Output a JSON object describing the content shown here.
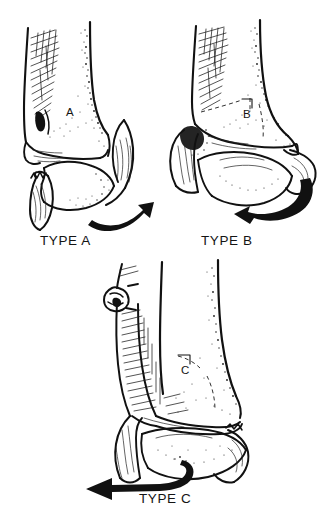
{
  "image": {
    "title": "Danis-Weber ankle fracture classification",
    "background_color": "#ffffff",
    "ink_color": "#111111",
    "style": "pen-and-ink line drawing with cross-hatching and stipple shading",
    "width": 329,
    "height": 523
  },
  "panels": [
    {
      "id": "type-a",
      "caption": "TYPE A",
      "bone_label": "A",
      "description": "Ankle mortise, anterior view. Transverse fibular fracture below the level of the syndesmosis, with the distal fibular fragment and talus displaced.",
      "fracture_level": "infrasyndesmotic",
      "arrow": {
        "name": "force-arrow-a",
        "direction": "curved sweep from lower-left upward to the right",
        "head": "up-right"
      }
    },
    {
      "id": "type-b",
      "caption": "TYPE B",
      "bone_label": "B",
      "description": "Ankle mortise, anterior view. Oblique fibular fracture beginning at the level of the syndesmosis, shown as a dashed fracture line.",
      "fracture_level": "transsyndesmotic",
      "arrow": {
        "name": "force-arrow-b",
        "direction": "curved sweep from upper-right downward around to the left",
        "head": "left"
      }
    },
    {
      "id": "type-c",
      "caption": "TYPE C",
      "bone_label": "C",
      "description": "Ankle mortise, anterior view. High fibular fracture above the syndesmosis with widening of the mortise and a dashed distal fracture line.",
      "fracture_level": "suprasyndesmotic",
      "arrow": {
        "name": "force-arrow-c",
        "direction": "hooked tail at right sweeping to a straight horizontal shaft",
        "head": "left"
      }
    }
  ],
  "captions": {
    "a": "TYPE A",
    "b": "TYPE B",
    "c": "TYPE C"
  },
  "bone_labels": {
    "a": "A",
    "b": "B",
    "c": "C"
  }
}
